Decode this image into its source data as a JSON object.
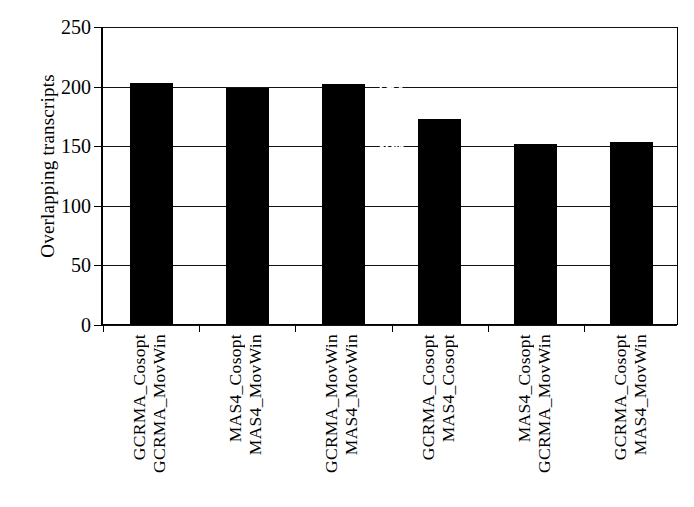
{
  "chart_data": {
    "type": "bar",
    "title": "",
    "xlabel": "",
    "ylabel": "Overlapping transcripts",
    "ylim": [
      0,
      250
    ],
    "ytick_values": [
      0,
      50,
      100,
      150,
      200,
      250
    ],
    "ytick_labels": [
      "0",
      "50",
      "100",
      "150",
      "200",
      "250"
    ],
    "grid": true,
    "legend": "none",
    "bar_color": "#000000",
    "label_color": "#ffffff",
    "categories": [
      "GCRMA_Cosopt\nGCRMA_MovWin",
      "MAS4_Cosopt\nMAS4_MovWin",
      "GCRMA_MovWin\nMAS4_MovWin",
      "GCRMA_Cosopt\nMAS4_Cosopt",
      "MAS4_Cosopt\nGCRMA_MovWin",
      "GCRMA_Cosopt\nMAS4_MovWin"
    ],
    "values": [
      202,
      198,
      201,
      172,
      151,
      153
    ],
    "secondary_values": [
      12,
      12,
      13,
      11,
      10,
      14
    ],
    "bars": [
      {
        "value": 202,
        "value_text": "202",
        "secondary_text": "(12)",
        "line1": "GCRMA_Cosopt",
        "line2": "GCRMA_MovWin"
      },
      {
        "value": 198,
        "value_text": "198",
        "secondary_text": "(12)",
        "line1": "MAS4_Cosopt",
        "line2": "MAS4_MovWin"
      },
      {
        "value": 201,
        "value_text": "201",
        "secondary_text": "(13)",
        "line1": "GCRMA_MovWin",
        "line2": "MAS4_MovWin"
      },
      {
        "value": 172,
        "value_text": "172",
        "secondary_text": "(11)",
        "line1": "GCRMA_Cosopt",
        "line2": "MAS4_Cosopt"
      },
      {
        "value": 151,
        "value_text": "151",
        "secondary_text": "(10)",
        "line1": "MAS4_Cosopt",
        "line2": "GCRMA_MovWin"
      },
      {
        "value": 153,
        "value_text": "153",
        "secondary_text": "(14)",
        "line1": "GCRMA_Cosopt",
        "line2": "MAS4_MovWin"
      }
    ]
  }
}
